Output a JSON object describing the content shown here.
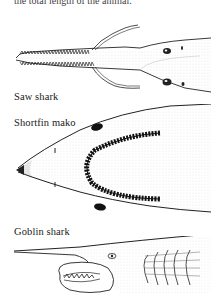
{
  "page": {
    "top_text": "the total length of the animal.",
    "illustrations": [
      {
        "caption": "Saw shark",
        "subject": "saw-shark-head"
      },
      {
        "caption": "Shortfin mako",
        "subject": "shortfin-mako-head"
      },
      {
        "caption": "Goblin shark",
        "subject": "goblin-shark-head"
      }
    ]
  }
}
